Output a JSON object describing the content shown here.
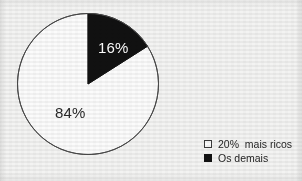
{
  "chart_data": {
    "type": "pie",
    "title": "",
    "categories": [
      "20% mais ricos",
      "Os demais"
    ],
    "values": [
      84,
      16
    ],
    "value_labels": [
      "84%",
      "16%"
    ],
    "unit": "%",
    "start_angle_deg": 0,
    "direction": "clockwise",
    "legend_position": "bottom-right",
    "grid": false,
    "slices": [
      {
        "label": "20% mais ricos",
        "value": 84,
        "display": "84%",
        "color": "#fbfbfb",
        "text_color": "#2a2a2a",
        "start_deg": 57.6,
        "end_deg": 360
      },
      {
        "label": "Os demais",
        "value": 16,
        "display": "16%",
        "color": "#111111",
        "text_color": "#fdfdfd",
        "start_deg": 0,
        "end_deg": 57.6
      }
    ]
  },
  "chart": {
    "center_x": 88,
    "center_y": 84,
    "radius": 70.5,
    "outline_color": "#4a4a4a",
    "outline_width": 1
  },
  "labels": {
    "dark_slice": "16%",
    "light_slice": "84%"
  },
  "legend": {
    "items": [
      {
        "label": "20%  mais ricos",
        "swatch": "hollow",
        "color": "#fbfbfb"
      },
      {
        "label": "Os demais",
        "swatch": "filled",
        "color": "#111111"
      }
    ]
  },
  "colors": {
    "background": "#f3f3f2",
    "slice_dark": "#111111",
    "slice_light": "#fbfbfb",
    "outline": "#4a4a4a",
    "text": "#1f1f1f"
  }
}
